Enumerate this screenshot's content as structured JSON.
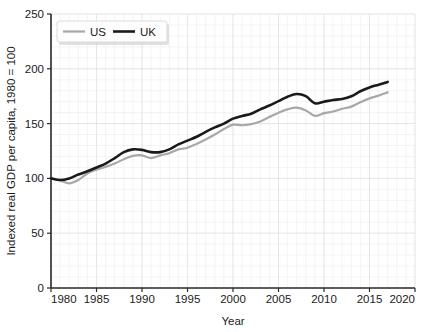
{
  "chart_data": {
    "type": "line",
    "title": "",
    "xlabel": "Year",
    "ylabel": "Indexed real GDP per capita, 1980 = 100",
    "xlim": [
      1980,
      2020
    ],
    "ylim": [
      0,
      250
    ],
    "xticks": [
      1980,
      1985,
      1990,
      1995,
      2000,
      2005,
      2010,
      2015,
      2020
    ],
    "yticks": [
      0,
      50,
      100,
      150,
      200,
      250
    ],
    "xtick_labels": [
      "1980",
      "1985",
      "1990",
      "1995",
      "2000",
      "2005",
      "2010",
      "2015",
      "2020"
    ],
    "ytick_labels": [
      "0",
      "50",
      "100",
      "150",
      "200",
      "250"
    ],
    "grid": true,
    "grid_style": "faint minor gridlines",
    "legend_position": "top-left inside plot",
    "x": [
      1980,
      1981,
      1982,
      1983,
      1984,
      1985,
      1986,
      1987,
      1988,
      1989,
      1990,
      1991,
      1992,
      1993,
      1994,
      1995,
      1996,
      1997,
      1998,
      1999,
      2000,
      2001,
      2002,
      2003,
      2004,
      2005,
      2006,
      2007,
      2008,
      2009,
      2010,
      2011,
      2012,
      2013,
      2014,
      2015,
      2016,
      2017
    ],
    "series": [
      {
        "name": "US",
        "color": "#a8a8a8",
        "values": [
          100,
          98.2,
          95.5,
          98.5,
          104.5,
          108.0,
          110.5,
          113.5,
          117.5,
          120.5,
          121.0,
          118.5,
          121.0,
          123.0,
          126.5,
          128.0,
          131.5,
          135.5,
          140.0,
          145.0,
          149.0,
          148.5,
          149.5,
          152.0,
          156.0,
          160.0,
          163.0,
          164.5,
          162.0,
          157.0,
          159.5,
          161.0,
          163.5,
          165.5,
          169.5,
          173.0,
          175.5,
          178.5
        ]
      },
      {
        "name": "UK",
        "color": "#1a1a1a",
        "values": [
          100,
          98.5,
          100.0,
          103.5,
          106.5,
          110.0,
          113.5,
          118.5,
          124.0,
          126.5,
          126.0,
          124.0,
          124.0,
          126.5,
          131.0,
          134.5,
          138.0,
          142.5,
          146.5,
          150.0,
          154.5,
          157.0,
          159.0,
          163.0,
          166.5,
          170.5,
          174.5,
          177.0,
          175.0,
          168.5,
          170.0,
          171.5,
          172.5,
          175.0,
          179.5,
          183.0,
          185.5,
          188.0
        ]
      }
    ],
    "legend": [
      {
        "label": "US",
        "color": "#a8a8a8"
      },
      {
        "label": "UK",
        "color": "#1a1a1a"
      }
    ]
  },
  "axes": {
    "y_axis_title": "Indexed real GDP per capita, 1980 = 100",
    "x_axis_title": "Year"
  }
}
